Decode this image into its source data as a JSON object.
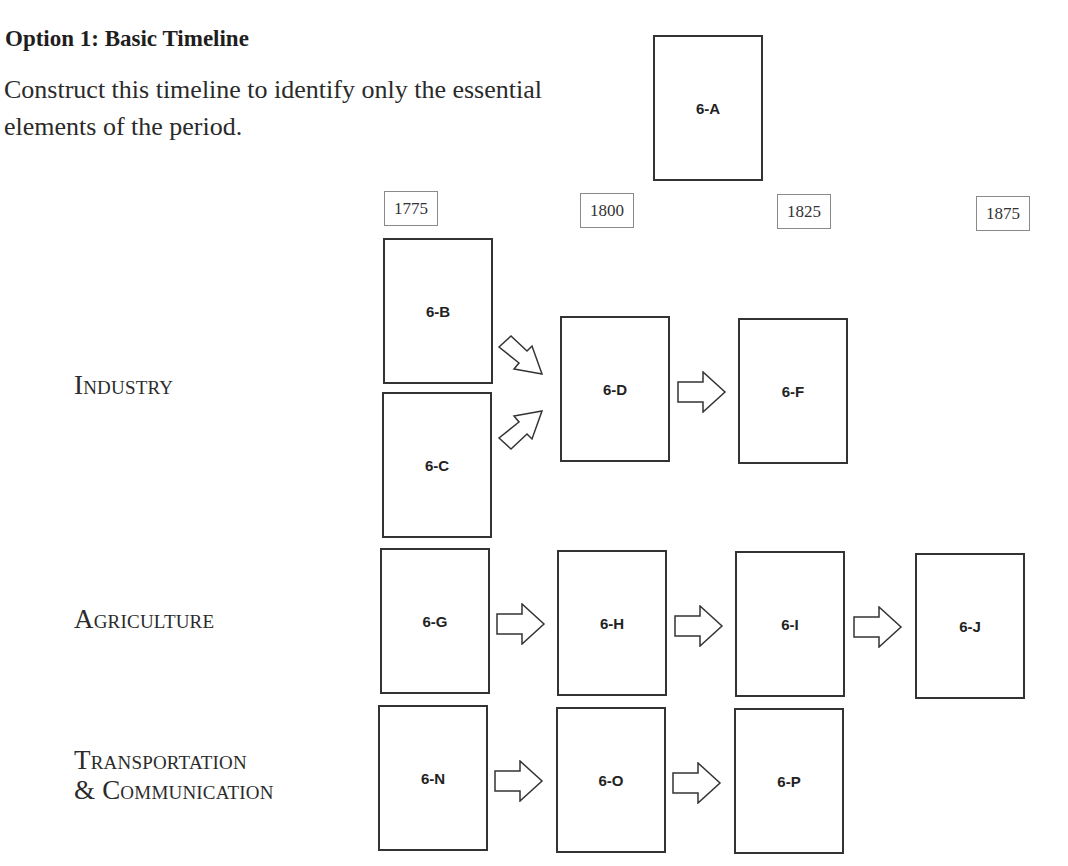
{
  "header": {
    "title": "Option 1: Basic Timeline",
    "subtitle": "Construct this timeline to identify only the essential elements of the period."
  },
  "years": [
    "1775",
    "1800",
    "1825",
    "1875"
  ],
  "rows": {
    "industry": "Industry",
    "agriculture": "Agriculture",
    "transportation_line1": "Transportation",
    "transportation_line2": "& Communication"
  },
  "boxes": {
    "a": "6-A",
    "b": "6-B",
    "c": "6-C",
    "d": "6-D",
    "f": "6-F",
    "g": "6-G",
    "h": "6-H",
    "i": "6-I",
    "j": "6-J",
    "n": "6-N",
    "o": "6-O",
    "p": "6-P"
  },
  "icons": {
    "arrow": "right-block-arrow",
    "diag_down": "down-right-block-arrow",
    "diag_up": "up-right-block-arrow"
  },
  "colors": {
    "stroke": "#333333",
    "text": "#222222",
    "year_border": "#8a8a8a"
  }
}
